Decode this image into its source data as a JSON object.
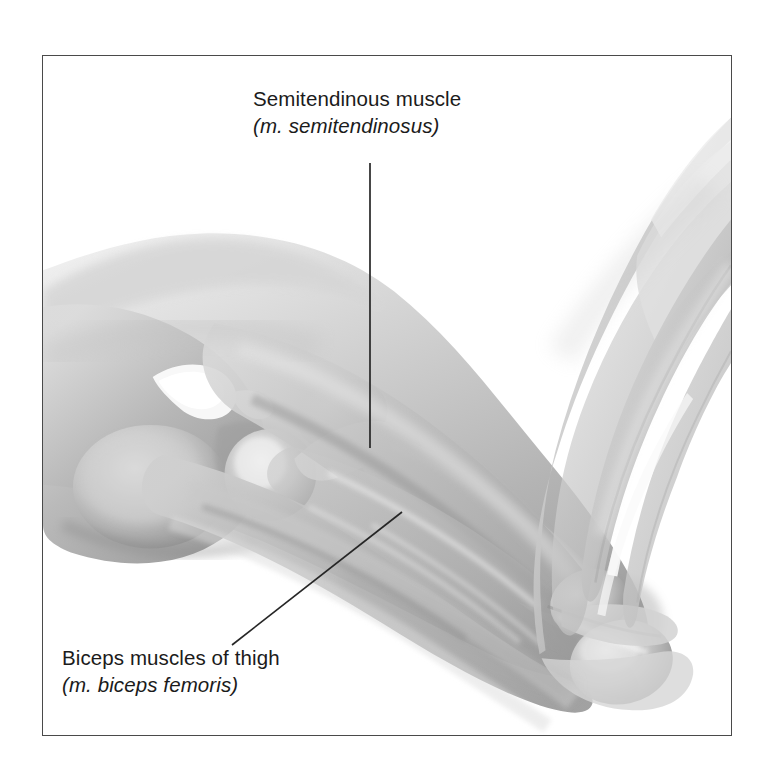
{
  "figure": {
    "type": "anatomical-illustration",
    "frame": {
      "border_color": "#4a4a4a",
      "background_color": "#ffffff",
      "x": 42,
      "y": 55,
      "width": 690,
      "height": 681
    },
    "page_background": "#ffffff",
    "text_color": "#1b1b1b"
  },
  "annotations": [
    {
      "id": "semitendinosus",
      "common_name": "Semitendinous muscle",
      "latin_name": "(m. semitendinosus)",
      "leader": {
        "style": "straight-vertical",
        "color": "#262626",
        "x1": 370,
        "y1": 163,
        "x2": 370,
        "y2": 448
      }
    },
    {
      "id": "biceps-femoris",
      "common_name": "Biceps muscles of thigh",
      "latin_name": "(m. biceps femoris)",
      "leader": {
        "style": "straight-diagonal",
        "color": "#262626",
        "x1": 232,
        "y1": 645,
        "x2": 402,
        "y2": 512
      }
    }
  ],
  "palette": {
    "tissue_light": "#e2e2e2",
    "tissue_mid": "#c4c4c4",
    "tissue_mid_dark": "#a9a9a9",
    "tissue_dark": "#8c8c8c",
    "tissue_darkest": "#6e6e6e",
    "highlight": "#f2f2f2",
    "leader_line": "#262626"
  }
}
